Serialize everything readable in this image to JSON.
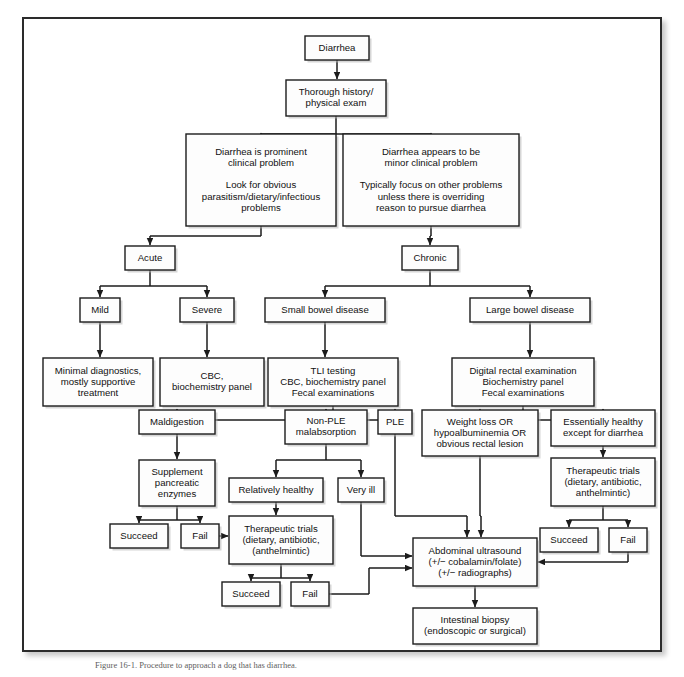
{
  "figure": {
    "caption": "Figure 16-1. Procedure to approach a dog that has diarrhea.",
    "frame_color": "#2b2b2b",
    "box_fill": "#fdfdfd",
    "line_color": "#1c1c1c"
  },
  "chart_data": {
    "type": "diagram",
    "nodes": [
      {
        "id": "diarrhea",
        "lines": [
          "Diarrhea"
        ],
        "x": 305,
        "y": 36,
        "w": 64,
        "h": 24
      },
      {
        "id": "history",
        "lines": [
          "Thorough history/",
          "physical exam"
        ],
        "x": 286,
        "y": 80,
        "w": 100,
        "h": 36
      },
      {
        "id": "prominent",
        "lines": [
          "Diarrhea is prominent",
          "clinical problem",
          "",
          "Look for obvious",
          "parasitism/dietary/infectious",
          "problems"
        ],
        "x": 186,
        "y": 134,
        "w": 150,
        "h": 92
      },
      {
        "id": "minor",
        "lines": [
          "Diarrhea appears to be",
          "minor clinical problem",
          "",
          "Typically focus on other problems",
          "unless there is overriding",
          "reason to pursue diarrhea"
        ],
        "x": 343,
        "y": 134,
        "w": 176,
        "h": 92
      },
      {
        "id": "acute",
        "lines": [
          "Acute"
        ],
        "x": 125,
        "y": 246,
        "w": 50,
        "h": 24
      },
      {
        "id": "chronic",
        "lines": [
          "Chronic"
        ],
        "x": 402,
        "y": 246,
        "w": 56,
        "h": 24
      },
      {
        "id": "mild",
        "lines": [
          "Mild"
        ],
        "x": 80,
        "y": 298,
        "w": 40,
        "h": 24
      },
      {
        "id": "severe",
        "lines": [
          "Severe"
        ],
        "x": 180,
        "y": 298,
        "w": 54,
        "h": 24
      },
      {
        "id": "smallbowel",
        "lines": [
          "Small bowel disease"
        ],
        "x": 265,
        "y": 298,
        "w": 120,
        "h": 24
      },
      {
        "id": "largebowel",
        "lines": [
          "Large bowel disease"
        ],
        "x": 470,
        "y": 298,
        "w": 120,
        "h": 24
      },
      {
        "id": "minimal",
        "lines": [
          "Minimal diagnostics,",
          "mostly supportive",
          "treatment"
        ],
        "x": 43,
        "y": 358,
        "w": 110,
        "h": 48
      },
      {
        "id": "cbc",
        "lines": [
          "CBC,",
          "biochemistry panel"
        ],
        "x": 160,
        "y": 358,
        "w": 104,
        "h": 48
      },
      {
        "id": "tli",
        "lines": [
          "TLI testing",
          "CBC, biochemistry panel",
          "Fecal examinations"
        ],
        "x": 268,
        "y": 358,
        "w": 130,
        "h": 48
      },
      {
        "id": "digital",
        "lines": [
          "Digital rectal examination",
          "Biochemistry panel",
          "Fecal examinations"
        ],
        "x": 452,
        "y": 358,
        "w": 142,
        "h": 48
      },
      {
        "id": "maldigestion",
        "lines": [
          "Maldigestion"
        ],
        "x": 139,
        "y": 410,
        "w": 76,
        "h": 24
      },
      {
        "id": "nonple",
        "lines": [
          "Non-PLE",
          "malabsorption"
        ],
        "x": 285,
        "y": 410,
        "w": 82,
        "h": 34
      },
      {
        "id": "ple",
        "lines": [
          "PLE"
        ],
        "x": 378,
        "y": 410,
        "w": 34,
        "h": 24
      },
      {
        "id": "weightloss",
        "lines": [
          "Weight loss OR",
          "hypoalbuminemia OR",
          "obvious rectal lesion"
        ],
        "x": 422,
        "y": 410,
        "w": 116,
        "h": 46
      },
      {
        "id": "essentially",
        "lines": [
          "Essentially healthy",
          "except for diarrhea"
        ],
        "x": 551,
        "y": 410,
        "w": 104,
        "h": 36
      },
      {
        "id": "supplement",
        "lines": [
          "Supplement",
          "pancreatic",
          "enzymes"
        ],
        "x": 139,
        "y": 460,
        "w": 76,
        "h": 46
      },
      {
        "id": "relatively",
        "lines": [
          "Relatively healthy"
        ],
        "x": 229,
        "y": 478,
        "w": 94,
        "h": 24
      },
      {
        "id": "veryill",
        "lines": [
          "Very ill"
        ],
        "x": 338,
        "y": 478,
        "w": 46,
        "h": 24
      },
      {
        "id": "theratrials_r",
        "lines": [
          "Therapeutic trials",
          "(dietary, antibiotic,",
          "anthelmintic)"
        ],
        "x": 551,
        "y": 458,
        "w": 104,
        "h": 48
      },
      {
        "id": "succeed_l",
        "lines": [
          "Succeed"
        ],
        "x": 110,
        "y": 524,
        "w": 58,
        "h": 24
      },
      {
        "id": "fail_l",
        "lines": [
          "Fail"
        ],
        "x": 181,
        "y": 524,
        "w": 38,
        "h": 24
      },
      {
        "id": "theratrials_c",
        "lines": [
          "Therapeutic trials",
          "(dietary, antibiotic,",
          "(anthelmintic)"
        ],
        "x": 229,
        "y": 516,
        "w": 104,
        "h": 48
      },
      {
        "id": "succeed_r",
        "lines": [
          "Succeed"
        ],
        "x": 540,
        "y": 528,
        "w": 58,
        "h": 24
      },
      {
        "id": "fail_r",
        "lines": [
          "Fail"
        ],
        "x": 609,
        "y": 528,
        "w": 38,
        "h": 24
      },
      {
        "id": "succeed_b",
        "lines": [
          "Succeed"
        ],
        "x": 222,
        "y": 582,
        "w": 58,
        "h": 24
      },
      {
        "id": "fail_b",
        "lines": [
          "Fail"
        ],
        "x": 291,
        "y": 582,
        "w": 38,
        "h": 24
      },
      {
        "id": "ultrasound",
        "lines": [
          "Abdominal ultrasound",
          "(+/− cobalamin/folate)",
          "(+/− radiographs)"
        ],
        "x": 413,
        "y": 538,
        "w": 124,
        "h": 48
      },
      {
        "id": "biopsy",
        "lines": [
          "Intestinal biopsy",
          "(endoscopic or surgical)"
        ],
        "x": 413,
        "y": 608,
        "w": 124,
        "h": 36
      }
    ],
    "edges": [
      {
        "from": "diarrhea",
        "to": "history"
      },
      {
        "from": "history",
        "to": "prominent"
      },
      {
        "from": "history",
        "to": "minor"
      },
      {
        "from": "prominent",
        "to": "acute"
      },
      {
        "from": "minor",
        "to": "chronic"
      },
      {
        "from": "acute",
        "to": "mild"
      },
      {
        "from": "acute",
        "to": "severe"
      },
      {
        "from": "chronic",
        "to": "smallbowel"
      },
      {
        "from": "chronic",
        "to": "largebowel"
      },
      {
        "from": "mild",
        "to": "minimal"
      },
      {
        "from": "severe",
        "to": "cbc"
      },
      {
        "from": "smallbowel",
        "to": "tli"
      },
      {
        "from": "largebowel",
        "to": "digital"
      },
      {
        "from": "tli",
        "to": "maldigestion"
      },
      {
        "from": "tli",
        "to": "nonple"
      },
      {
        "from": "tli",
        "to": "ple"
      },
      {
        "from": "digital",
        "to": "weightloss"
      },
      {
        "from": "digital",
        "to": "essentially"
      },
      {
        "from": "maldigestion",
        "to": "supplement"
      },
      {
        "from": "supplement",
        "to": "succeed_l"
      },
      {
        "from": "supplement",
        "to": "fail_l"
      },
      {
        "from": "nonple",
        "to": "relatively"
      },
      {
        "from": "nonple",
        "to": "veryill"
      },
      {
        "from": "relatively",
        "to": "theratrials_c"
      },
      {
        "from": "fail_l",
        "to": "theratrials_c"
      },
      {
        "from": "theratrials_c",
        "to": "succeed_b"
      },
      {
        "from": "theratrials_c",
        "to": "fail_b"
      },
      {
        "from": "fail_b",
        "to": "ultrasound"
      },
      {
        "from": "veryill",
        "to": "ultrasound"
      },
      {
        "from": "ple",
        "to": "ultrasound"
      },
      {
        "from": "weightloss",
        "to": "ultrasound"
      },
      {
        "from": "essentially",
        "to": "theratrials_r"
      },
      {
        "from": "theratrials_r",
        "to": "succeed_r"
      },
      {
        "from": "theratrials_r",
        "to": "fail_r"
      },
      {
        "from": "fail_r",
        "to": "ultrasound"
      },
      {
        "from": "ultrasound",
        "to": "biopsy"
      }
    ]
  }
}
